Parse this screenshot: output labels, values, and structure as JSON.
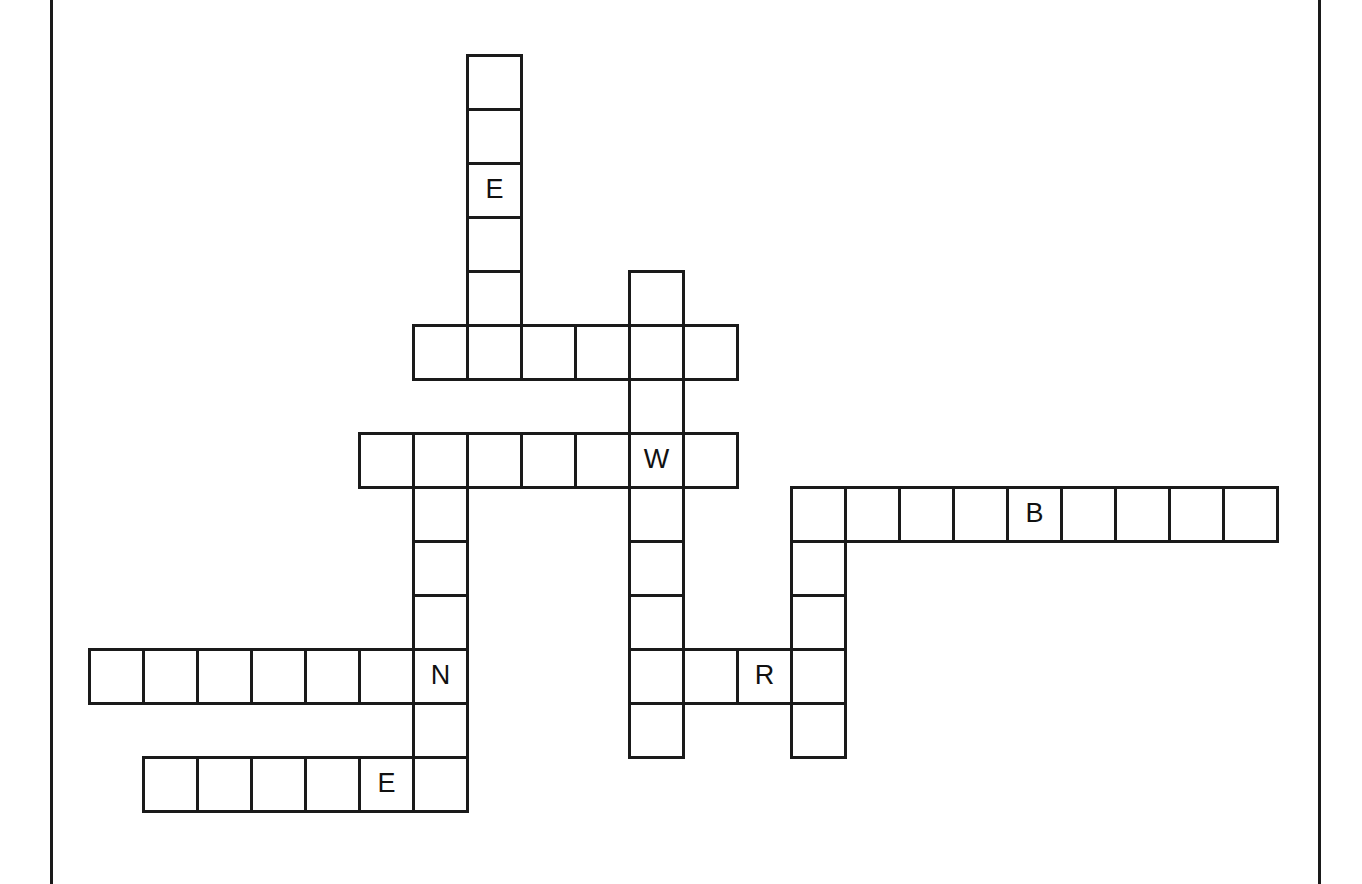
{
  "page": {
    "background_color": "#ffffff",
    "width": 1362,
    "height": 884
  },
  "frame": {
    "left_rule_label": "page-left-margin-rule",
    "right_rule_label": "page-right-margin-rule",
    "color": "#1a1a1a"
  },
  "grid": {
    "cell_size": 54,
    "origin_x": 88,
    "origin_y": 54,
    "border_color": "#1a1a1a",
    "cell_color": "#ffffff",
    "letter_color": "#111111"
  },
  "entries": [
    {
      "id": "down-1",
      "direction": "down",
      "start_col": 7,
      "start_row": 0,
      "length": 5
    },
    {
      "id": "across-1",
      "direction": "across",
      "start_col": 6,
      "start_row": 5,
      "length": 6
    },
    {
      "id": "down-2",
      "direction": "down",
      "start_col": 10,
      "start_row": 4,
      "length": 9
    },
    {
      "id": "across-2",
      "direction": "across",
      "start_col": 5,
      "start_row": 7,
      "length": 7
    },
    {
      "id": "down-3",
      "direction": "down",
      "start_col": 6,
      "start_row": 7,
      "length": 8
    },
    {
      "id": "across-3",
      "direction": "across",
      "start_col": 13,
      "start_row": 8,
      "length": 9
    },
    {
      "id": "down-4",
      "direction": "down",
      "start_col": 13,
      "start_row": 8,
      "length": 5
    },
    {
      "id": "across-4",
      "direction": "across",
      "start_col": 0,
      "start_row": 11,
      "length": 7
    },
    {
      "id": "across-5",
      "direction": "across",
      "start_col": 10,
      "start_row": 11,
      "length": 4
    },
    {
      "id": "across-6",
      "direction": "across",
      "start_col": 1,
      "start_row": 13,
      "length": 6
    }
  ],
  "cells": [
    {
      "col": 7,
      "row": 0,
      "letter": ""
    },
    {
      "col": 7,
      "row": 1,
      "letter": ""
    },
    {
      "col": 7,
      "row": 2,
      "letter": "E"
    },
    {
      "col": 7,
      "row": 3,
      "letter": ""
    },
    {
      "col": 7,
      "row": 4,
      "letter": ""
    },
    {
      "col": 6,
      "row": 5,
      "letter": ""
    },
    {
      "col": 7,
      "row": 5,
      "letter": ""
    },
    {
      "col": 8,
      "row": 5,
      "letter": ""
    },
    {
      "col": 9,
      "row": 5,
      "letter": ""
    },
    {
      "col": 10,
      "row": 5,
      "letter": ""
    },
    {
      "col": 11,
      "row": 5,
      "letter": ""
    },
    {
      "col": 10,
      "row": 4,
      "letter": ""
    },
    {
      "col": 10,
      "row": 6,
      "letter": ""
    },
    {
      "col": 5,
      "row": 7,
      "letter": ""
    },
    {
      "col": 6,
      "row": 7,
      "letter": ""
    },
    {
      "col": 7,
      "row": 7,
      "letter": ""
    },
    {
      "col": 8,
      "row": 7,
      "letter": ""
    },
    {
      "col": 9,
      "row": 7,
      "letter": ""
    },
    {
      "col": 10,
      "row": 7,
      "letter": "W"
    },
    {
      "col": 11,
      "row": 7,
      "letter": ""
    },
    {
      "col": 10,
      "row": 8,
      "letter": ""
    },
    {
      "col": 10,
      "row": 9,
      "letter": ""
    },
    {
      "col": 10,
      "row": 10,
      "letter": ""
    },
    {
      "col": 10,
      "row": 12,
      "letter": ""
    },
    {
      "col": 6,
      "row": 8,
      "letter": ""
    },
    {
      "col": 6,
      "row": 9,
      "letter": ""
    },
    {
      "col": 6,
      "row": 10,
      "letter": ""
    },
    {
      "col": 6,
      "row": 12,
      "letter": ""
    },
    {
      "col": 6,
      "row": 13,
      "letter": ""
    },
    {
      "col": 13,
      "row": 8,
      "letter": ""
    },
    {
      "col": 14,
      "row": 8,
      "letter": ""
    },
    {
      "col": 15,
      "row": 8,
      "letter": ""
    },
    {
      "col": 16,
      "row": 8,
      "letter": ""
    },
    {
      "col": 17,
      "row": 8,
      "letter": "B"
    },
    {
      "col": 18,
      "row": 8,
      "letter": ""
    },
    {
      "col": 19,
      "row": 8,
      "letter": ""
    },
    {
      "col": 20,
      "row": 8,
      "letter": ""
    },
    {
      "col": 21,
      "row": 8,
      "letter": ""
    },
    {
      "col": 13,
      "row": 9,
      "letter": ""
    },
    {
      "col": 13,
      "row": 10,
      "letter": ""
    },
    {
      "col": 13,
      "row": 12,
      "letter": ""
    },
    {
      "col": 0,
      "row": 11,
      "letter": ""
    },
    {
      "col": 1,
      "row": 11,
      "letter": ""
    },
    {
      "col": 2,
      "row": 11,
      "letter": ""
    },
    {
      "col": 3,
      "row": 11,
      "letter": ""
    },
    {
      "col": 4,
      "row": 11,
      "letter": ""
    },
    {
      "col": 5,
      "row": 11,
      "letter": ""
    },
    {
      "col": 6,
      "row": 11,
      "letter": "N"
    },
    {
      "col": 10,
      "row": 11,
      "letter": ""
    },
    {
      "col": 11,
      "row": 11,
      "letter": ""
    },
    {
      "col": 12,
      "row": 11,
      "letter": "R"
    },
    {
      "col": 13,
      "row": 11,
      "letter": ""
    },
    {
      "col": 1,
      "row": 13,
      "letter": ""
    },
    {
      "col": 2,
      "row": 13,
      "letter": ""
    },
    {
      "col": 3,
      "row": 13,
      "letter": ""
    },
    {
      "col": 4,
      "row": 13,
      "letter": ""
    },
    {
      "col": 5,
      "row": 13,
      "letter": "E"
    }
  ]
}
